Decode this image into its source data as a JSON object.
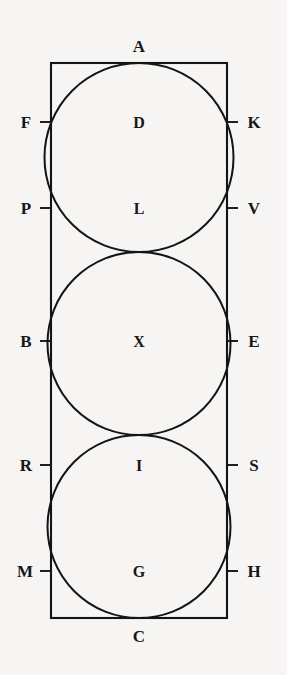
{
  "figure": {
    "type": "geometry-diagram",
    "colors": {
      "background": "#f6f5f3",
      "stroke": "#141414",
      "text": "#171717"
    },
    "canvas": {
      "width": 287,
      "height": 675
    },
    "rectangle": {
      "x": 51,
      "y": 63,
      "width": 176,
      "height": 555
    },
    "circles": [
      {
        "name": "top-circle",
        "cx": 139,
        "cy": 157.5,
        "r": 94.5
      },
      {
        "name": "middle-circle",
        "cx": 139,
        "cy": 343.5,
        "r": 91.5
      },
      {
        "name": "bottom-circle",
        "cx": 139,
        "cy": 526.5,
        "r": 91.5
      }
    ],
    "tick_length": 11,
    "labels": {
      "top": [
        {
          "id": "A",
          "text": "A",
          "x": 139,
          "y": 46
        }
      ],
      "bottom": [
        {
          "id": "C",
          "text": "C",
          "x": 139,
          "y": 636
        }
      ],
      "left": [
        {
          "id": "F",
          "text": "F",
          "x": 26,
          "y": 122,
          "tick_y": 122
        },
        {
          "id": "P",
          "text": "P",
          "x": 26,
          "y": 208,
          "tick_y": 208
        },
        {
          "id": "B",
          "text": "B",
          "x": 26,
          "y": 341,
          "tick_y": 341
        },
        {
          "id": "R",
          "text": "R",
          "x": 26,
          "y": 465,
          "tick_y": 465
        },
        {
          "id": "M",
          "text": "M",
          "x": 25,
          "y": 571,
          "tick_y": 571
        }
      ],
      "right": [
        {
          "id": "K",
          "text": "K",
          "x": 254,
          "y": 122,
          "tick_y": 122
        },
        {
          "id": "V",
          "text": "V",
          "x": 254,
          "y": 208,
          "tick_y": 208
        },
        {
          "id": "E",
          "text": "E",
          "x": 254,
          "y": 341,
          "tick_y": 341
        },
        {
          "id": "S",
          "text": "S",
          "x": 254,
          "y": 465,
          "tick_y": 465
        },
        {
          "id": "H",
          "text": "H",
          "x": 254,
          "y": 571,
          "tick_y": 571
        }
      ],
      "interior": [
        {
          "id": "D",
          "text": "D",
          "x": 139,
          "y": 122
        },
        {
          "id": "L",
          "text": "L",
          "x": 139,
          "y": 208
        },
        {
          "id": "X",
          "text": "X",
          "x": 139,
          "y": 341
        },
        {
          "id": "I",
          "text": "I",
          "x": 139,
          "y": 465
        },
        {
          "id": "G",
          "text": "G",
          "x": 139,
          "y": 571
        }
      ]
    }
  }
}
